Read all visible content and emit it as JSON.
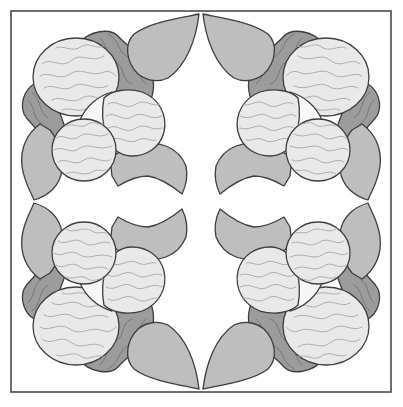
{
  "artwork": {
    "title": "",
    "description": "Four-fold symmetric appliqué quilt block: four flower clusters of marbled discs, dark marbled blobs and gray leaves inside a square frame",
    "layout": "top-left quadrant mirrored horizontally and vertically",
    "quadrants": [
      "top-left",
      "top-right",
      "bottom-left",
      "bottom-right"
    ]
  },
  "colors": {
    "background": "#ffffff",
    "frame": "#4a4a4a",
    "outline": "#3f3f3f",
    "disc_fill": "#e9e9e9",
    "disc_swirl": "#9f9f9f",
    "blob_fill": "#9c9c9c",
    "blob_swirl": "#6f6f6f",
    "leaf_fill": "#bebebe",
    "lens_fill": "#f7f7f7"
  },
  "frame": {
    "x": 11,
    "y": 11,
    "width": 380,
    "height": 381
  }
}
